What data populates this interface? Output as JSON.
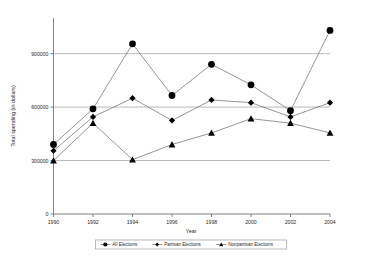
{
  "chart_data": {
    "type": "line",
    "title": "",
    "xlabel": "Year",
    "ylabel": "Total spending (in dollars)",
    "x": [
      1990,
      1992,
      1994,
      1996,
      1998,
      2000,
      2002,
      2004
    ],
    "xtick_labels": [
      "1990",
      "1992",
      "1994",
      "1996",
      "1998",
      "2000",
      "2002",
      "2004"
    ],
    "ytick_labels": [
      "0",
      "300000",
      "600000",
      "900000"
    ],
    "ytick_values": [
      0,
      300000,
      600000,
      900000
    ],
    "ylim": [
      0,
      1100000
    ],
    "xlim": [
      1990,
      2004
    ],
    "grid": "horizontal",
    "legend_position": "bottom",
    "series": [
      {
        "name": "All Elections",
        "marker": "circle",
        "color": "#000000",
        "values": [
          390000,
          590000,
          955000,
          665000,
          840000,
          725000,
          580000,
          1030000
        ]
      },
      {
        "name": "Partisan Elections",
        "marker": "diamond",
        "color": "#000000",
        "values": [
          355000,
          545000,
          650000,
          525000,
          640000,
          625000,
          545000,
          625000
        ]
      },
      {
        "name": "Nonpartisan Elections",
        "marker": "triangle",
        "color": "#000000",
        "values": [
          300000,
          510000,
          305000,
          390000,
          455000,
          535000,
          510000,
          455000
        ]
      }
    ]
  },
  "colors": {
    "plot_line": "#7a7a7a",
    "grid": "#a8a8a8",
    "axis": "#808080",
    "marker": "#000000",
    "background": "#ffffff",
    "text": "#2b2b2b"
  }
}
